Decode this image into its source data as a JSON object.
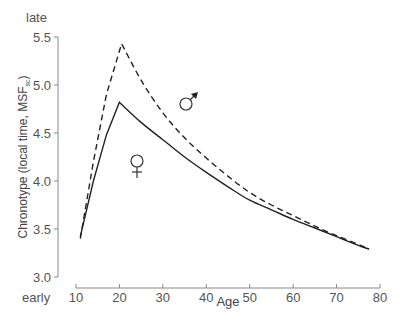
{
  "chart_data": {
    "type": "line",
    "title": "",
    "xlabel": "Age",
    "ylabel": "Chronotype (local time, MSF",
    "ylabel_subscript": "sc",
    "ylabel_suffix": ")",
    "xlim": [
      10,
      80
    ],
    "ylim": [
      3.0,
      5.5
    ],
    "x_ticks": [
      10,
      20,
      30,
      40,
      50,
      60,
      70,
      80
    ],
    "y_ticks": [
      3.0,
      3.5,
      4.0,
      4.5,
      5.0,
      5.5
    ],
    "y_tick_labels": [
      "3.0",
      "3.5",
      "4.0",
      "4.5",
      "5.0",
      "5.5"
    ],
    "y_top_annotation": "late",
    "y_bottom_annotation": "early",
    "grid": false,
    "legend": "inline symbols",
    "series": [
      {
        "name": "male",
        "symbol": "♂",
        "style": "dashed",
        "color": "#222222",
        "points": [
          [
            11,
            3.4
          ],
          [
            14,
            4.2
          ],
          [
            17,
            4.9
          ],
          [
            20.5,
            5.43
          ],
          [
            25,
            5.05
          ],
          [
            30,
            4.71
          ],
          [
            35,
            4.45
          ],
          [
            40,
            4.24
          ],
          [
            45,
            4.05
          ],
          [
            50,
            3.88
          ],
          [
            55,
            3.75
          ],
          [
            60,
            3.64
          ],
          [
            65,
            3.53
          ],
          [
            70,
            3.43
          ],
          [
            75,
            3.34
          ],
          [
            77.5,
            3.29
          ]
        ]
      },
      {
        "name": "female",
        "symbol": "♀",
        "style": "solid",
        "color": "#222222",
        "points": [
          [
            11,
            3.42
          ],
          [
            14,
            4.0
          ],
          [
            17,
            4.48
          ],
          [
            20,
            4.82
          ],
          [
            25,
            4.61
          ],
          [
            30,
            4.43
          ],
          [
            35,
            4.25
          ],
          [
            40,
            4.09
          ],
          [
            45,
            3.94
          ],
          [
            50,
            3.8
          ],
          [
            55,
            3.7
          ],
          [
            60,
            3.6
          ],
          [
            65,
            3.51
          ],
          [
            70,
            3.42
          ],
          [
            75,
            3.33
          ],
          [
            77.5,
            3.29
          ]
        ]
      }
    ],
    "annotations": [
      {
        "text": "♂",
        "age": 36,
        "value": 4.8
      },
      {
        "text": "♀",
        "age": 24,
        "value": 4.15
      }
    ]
  }
}
